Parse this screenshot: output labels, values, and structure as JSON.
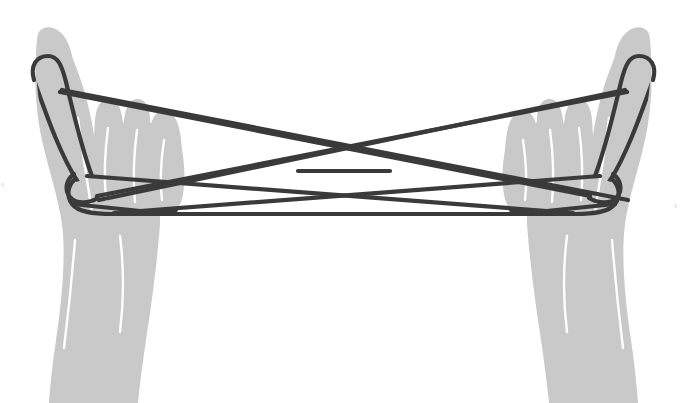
{
  "illustration": {
    "title": "String figure held between two hands",
    "subject": "cat's cradle string figure",
    "background_color": "#ffffff",
    "hand_color": "#c9c9c9",
    "hand_crease_color": "#ffffff",
    "string_color": "#3a3a3a",
    "string_width_px": 4.2,
    "canvas": {
      "width": 687,
      "height": 403
    }
  },
  "hands": {
    "left": {
      "label": "left hand",
      "orientation": "palm facing viewer, index finger extended upward",
      "index_finger_tip": {
        "x": 42,
        "y": 40
      },
      "wrist_bottom": {
        "x": 120,
        "y": 403
      }
    },
    "right": {
      "label": "right hand",
      "orientation": "palm facing viewer, index finger extended upward",
      "index_finger_tip": {
        "x": 645,
        "y": 40
      },
      "wrist_bottom": {
        "x": 567,
        "y": 403
      }
    }
  },
  "strings": {
    "count": 7,
    "segments": [
      {
        "name": "upper-left-to-right-middle",
        "from": "left index finger",
        "to": "right hand middle"
      },
      {
        "name": "upper-right-to-left-middle",
        "from": "right index finger",
        "to": "left hand middle"
      },
      {
        "name": "center-horizontal-upper",
        "from": "left crossing",
        "to": "right crossing"
      },
      {
        "name": "diagonal-left-down-to-right",
        "from": "left hand lower",
        "to": "right hand upper"
      },
      {
        "name": "diagonal-right-down-to-left",
        "from": "right hand lower",
        "to": "left hand upper"
      },
      {
        "name": "bottom-horizontal",
        "from": "left hand bottom",
        "to": "right hand bottom"
      },
      {
        "name": "left-index-wrap-loop",
        "from": "left index finger",
        "to": "left palm"
      }
    ],
    "crossings": [
      {
        "name": "center-x-crossing",
        "x": 345,
        "y": 176
      },
      {
        "name": "left-upper-crossing",
        "x": 272,
        "y": 127
      },
      {
        "name": "right-upper-crossing",
        "x": 414,
        "y": 127
      }
    ]
  },
  "edge_marks": {
    "left": "6",
    "right": "6"
  }
}
